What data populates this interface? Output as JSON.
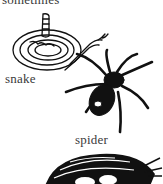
{
  "labels": {
    "top": "sometimes",
    "snake": "snake",
    "spider": "spider"
  },
  "illustrations": [
    {
      "name": "snake",
      "style": "line drawing, coiled rattlesnake"
    },
    {
      "name": "spider",
      "style": "black silhouette"
    },
    {
      "name": "nest",
      "style": "black woodcut bird nest with eggs"
    }
  ],
  "colors": {
    "background": "#ffffff",
    "ink": "#111111",
    "text": "#3a3a3a"
  }
}
